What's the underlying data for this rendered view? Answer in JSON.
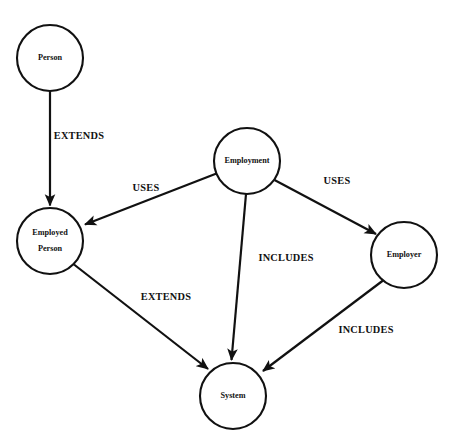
{
  "diagram": {
    "type": "directed-graph",
    "background_color": "#ffffff",
    "stroke_color": "#111111",
    "node_fill_color": "#ffffff",
    "nodes": [
      {
        "id": "person",
        "label": "Person",
        "label_lines": [
          "Person"
        ],
        "cx": 50,
        "cy": 58,
        "r": 33
      },
      {
        "id": "employed-person",
        "label": "Employed Person",
        "label_lines": [
          "Employed",
          "Person"
        ],
        "cx": 50,
        "cy": 241,
        "r": 33
      },
      {
        "id": "employment",
        "label": "Employment",
        "label_lines": [
          "Employment"
        ],
        "cx": 247,
        "cy": 161,
        "r": 33
      },
      {
        "id": "employer",
        "label": "Employer",
        "label_lines": [
          "Employer"
        ],
        "cx": 404,
        "cy": 255,
        "r": 33
      },
      {
        "id": "system",
        "label": "System",
        "label_lines": [
          "System"
        ],
        "cx": 233,
        "cy": 396,
        "r": 33
      }
    ],
    "edges": [
      {
        "id": "person-extends-employed-person",
        "from": "person",
        "to": "employed-person",
        "label": "EXTENDS",
        "label_x": 79,
        "label_y": 137
      },
      {
        "id": "employment-uses-employed-person",
        "from": "employment",
        "to": "employed-person",
        "label": "USES",
        "label_x": 146,
        "label_y": 189
      },
      {
        "id": "employment-uses-employer",
        "from": "employment",
        "to": "employer",
        "label": "USES",
        "label_x": 337,
        "label_y": 182
      },
      {
        "id": "employment-includes-system",
        "from": "employment",
        "to": "system",
        "label": "INCLUDES",
        "label_x": 286,
        "label_y": 259
      },
      {
        "id": "employed-person-extends-system",
        "from": "employed-person",
        "to": "system",
        "label": "EXTENDS",
        "label_x": 166,
        "label_y": 298
      },
      {
        "id": "employer-includes-system",
        "from": "employer",
        "to": "system",
        "label": "INCLUDES",
        "label_x": 366,
        "label_y": 331
      }
    ]
  }
}
